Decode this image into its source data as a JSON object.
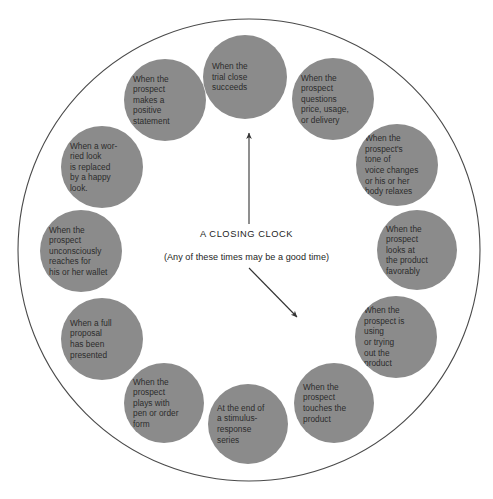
{
  "diagram": {
    "title": "A CLOSING CLOCK",
    "subtitle": "(Any of these times may be a good time)",
    "outer_ellipse_color": "#4a4a4a",
    "node_fill_color": "#8b8b8b",
    "node_text_color": "#2b2b2b",
    "arrow_color": "#333333",
    "background_color": "#ffffff",
    "node_count": 12,
    "nodes": [
      {
        "position": "12-oclock",
        "label": "When the\ntrial close\nsucceeds",
        "cx": 245,
        "cy": 77,
        "r": 42
      },
      {
        "position": "1-oclock",
        "label": "When the\nprospect\nquestions\nprice, usage,\nor delivery",
        "cx": 333,
        "cy": 99,
        "r": 41
      },
      {
        "position": "2-oclock",
        "label": "When the\nprospect's\ntone of\nvoice changes\nor his or her\nbody relaxes",
        "cx": 397,
        "cy": 165,
        "r": 41
      },
      {
        "position": "3-oclock",
        "label": "When the\nprospect\nlooks at\nthe product\nfavorably",
        "cx": 417,
        "cy": 250,
        "r": 40
      },
      {
        "position": "4-oclock",
        "label": "When the\nprospect is\nusing\nor trying\nout the\nproduct",
        "cx": 396,
        "cy": 337,
        "r": 41
      },
      {
        "position": "5-oclock",
        "label": "When the\nprospect\ntouches the\nproduct",
        "cx": 334,
        "cy": 403,
        "r": 40
      },
      {
        "position": "6-oclock",
        "label": "At the end of\na stimulus-\nresponse\nseries",
        "cx": 248,
        "cy": 424,
        "r": 40
      },
      {
        "position": "7-oclock",
        "label": "When the\nprospect\nplays with\npen or order\nform",
        "cx": 164,
        "cy": 403,
        "r": 40
      },
      {
        "position": "8-oclock",
        "label": "When a full\nproposal\nhas been\npresented",
        "cx": 102,
        "cy": 339,
        "r": 41
      },
      {
        "position": "9-oclock",
        "label": "When the\nprospect\nunconsciously\nreaches for\nhis or her wallet",
        "cx": 81,
        "cy": 251,
        "r": 41
      },
      {
        "position": "10-oclock",
        "label": "When a wor-\nried look\nis replaced\nby a happy\nlook.",
        "cx": 102,
        "cy": 167,
        "r": 41
      },
      {
        "position": "11-oclock",
        "label": "When the\nprospect\nmakes a\npositive\nstatement",
        "cx": 165,
        "cy": 100,
        "r": 41
      }
    ],
    "arrows": [
      {
        "name": "up-arrow",
        "x1": 249,
        "y1": 224,
        "x2": 249,
        "y2": 133
      },
      {
        "name": "down-right-arrow",
        "x1": 249,
        "y1": 268,
        "x2": 297,
        "y2": 317
      }
    ]
  }
}
